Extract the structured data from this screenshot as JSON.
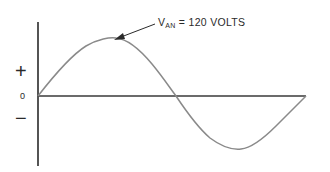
{
  "diagram": {
    "annotation": {
      "symbol": "V",
      "subscript": "AN",
      "equals": " = 120 VOLTS"
    },
    "axis_labels": {
      "positive": "+",
      "zero": "0",
      "negative": "−"
    },
    "colors": {
      "axis": "#2a2a2a",
      "wave": "#8a8a8a",
      "text": "#2a2a2a"
    },
    "waveform": {
      "type": "sine",
      "cycles": 1,
      "peak_label": "V_AN = 120 VOLTS"
    }
  }
}
